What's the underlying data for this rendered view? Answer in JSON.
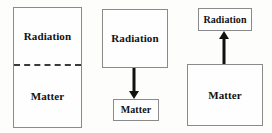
{
  "figure": {
    "background_color": "#fdfdfc",
    "border_color": "#8a8a8a",
    "arrow_color": "#111111",
    "text_color": "#111111"
  },
  "panels": [
    {
      "id": "panel-coupled",
      "description": "single region divided by dashed line",
      "divider_style": "dashed",
      "top_label": "Radiation",
      "bottom_label": "Matter"
    },
    {
      "id": "panel-radiation-to-matter",
      "description": "radiation box with arrow pointing down to matter box",
      "source_label": "Radiation",
      "target_label": "Matter",
      "arrow_direction": "down"
    },
    {
      "id": "panel-matter-to-radiation",
      "description": "matter box with arrow pointing up to radiation box",
      "source_label": "Matter",
      "target_label": "Radiation",
      "arrow_direction": "up"
    }
  ]
}
